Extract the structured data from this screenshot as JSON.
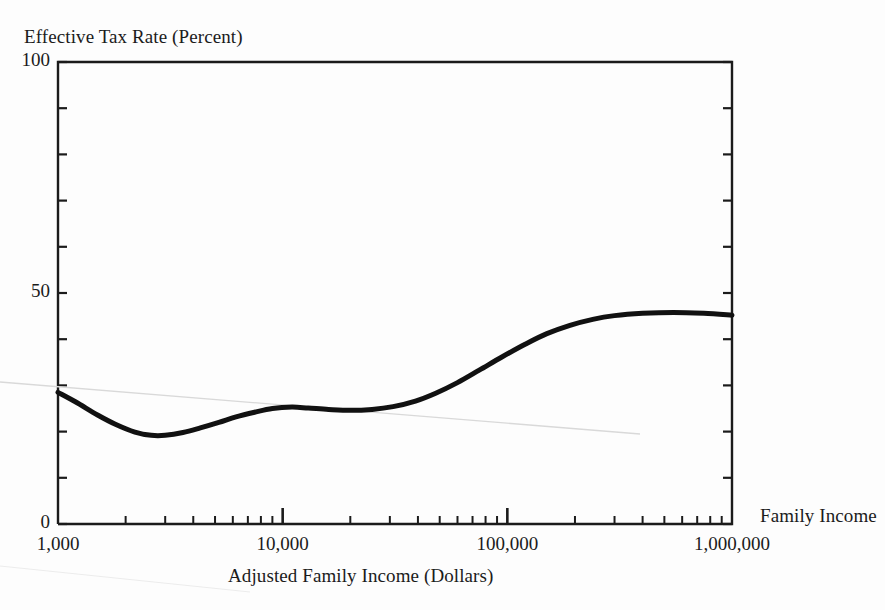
{
  "chart_data": {
    "type": "line",
    "title": "",
    "ylabel": "Effective Tax Rate (Percent)",
    "xlabel": "Adjusted Family Income (Dollars)",
    "annotation": "Family Income",
    "xscale": "log",
    "xlim": [
      1000,
      1000000
    ],
    "ylim": [
      0,
      100
    ],
    "grid": false,
    "legend": "none",
    "y_ticks": [
      0,
      10,
      20,
      30,
      40,
      50,
      60,
      70,
      80,
      90,
      100
    ],
    "y_tick_labels": [
      {
        "value": 0,
        "label": "0"
      },
      {
        "value": 50,
        "label": "50"
      },
      {
        "value": 100,
        "label": "100"
      }
    ],
    "x_major_ticks": [
      1000,
      10000,
      100000,
      1000000
    ],
    "x_tick_labels": [
      {
        "value": 1000,
        "label": "1,000"
      },
      {
        "value": 10000,
        "label": "10,000"
      },
      {
        "value": 100000,
        "label": "100,000"
      },
      {
        "value": 1000000,
        "label": "1,000,000"
      }
    ],
    "x_minor_ticks": [
      2000,
      3000,
      4000,
      5000,
      6000,
      7000,
      8000,
      9000,
      20000,
      30000,
      40000,
      50000,
      60000,
      70000,
      80000,
      90000,
      200000,
      300000,
      400000,
      500000,
      600000,
      700000,
      800000,
      900000
    ],
    "series": [
      {
        "name": "Effective Tax Rate",
        "color": "#111111",
        "linewidth": 5,
        "points": [
          {
            "x": 1000,
            "y": 28.5
          },
          {
            "x": 1200,
            "y": 26.4
          },
          {
            "x": 1500,
            "y": 23.6
          },
          {
            "x": 1800,
            "y": 21.6
          },
          {
            "x": 2200,
            "y": 19.9
          },
          {
            "x": 2600,
            "y": 19.2
          },
          {
            "x": 3000,
            "y": 19.2
          },
          {
            "x": 3600,
            "y": 19.8
          },
          {
            "x": 4300,
            "y": 20.8
          },
          {
            "x": 5200,
            "y": 22.0
          },
          {
            "x": 6200,
            "y": 23.2
          },
          {
            "x": 7500,
            "y": 24.2
          },
          {
            "x": 9000,
            "y": 25.0
          },
          {
            "x": 11000,
            "y": 25.3
          },
          {
            "x": 13000,
            "y": 25.1
          },
          {
            "x": 16000,
            "y": 24.8
          },
          {
            "x": 20000,
            "y": 24.6
          },
          {
            "x": 25000,
            "y": 24.8
          },
          {
            "x": 31000,
            "y": 25.4
          },
          {
            "x": 39000,
            "y": 26.6
          },
          {
            "x": 48000,
            "y": 28.3
          },
          {
            "x": 60000,
            "y": 30.6
          },
          {
            "x": 75000,
            "y": 33.3
          },
          {
            "x": 95000,
            "y": 36.2
          },
          {
            "x": 120000,
            "y": 38.9
          },
          {
            "x": 150000,
            "y": 41.2
          },
          {
            "x": 190000,
            "y": 43.0
          },
          {
            "x": 240000,
            "y": 44.3
          },
          {
            "x": 300000,
            "y": 45.1
          },
          {
            "x": 400000,
            "y": 45.6
          },
          {
            "x": 550000,
            "y": 45.8
          },
          {
            "x": 750000,
            "y": 45.6
          },
          {
            "x": 1000000,
            "y": 45.2
          }
        ]
      }
    ]
  }
}
